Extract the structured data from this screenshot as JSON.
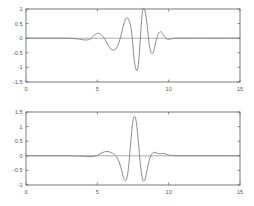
{
  "figure": {
    "title": "",
    "background_color": "#ffffff",
    "curve_color": "#777777",
    "axis_color": "#6b6b6b",
    "label_color": "#585858"
  },
  "chart_data": [
    {
      "type": "line",
      "title": "",
      "xlabel": "",
      "ylabel": "",
      "xlim": [
        0,
        15
      ],
      "ylim": [
        -1.5,
        1.0
      ],
      "grid": false,
      "legend": null,
      "xticks": [
        0,
        5,
        10,
        15
      ],
      "xticklabels": [
        "0",
        "5",
        "10",
        "15"
      ],
      "yticks": [
        1,
        0.5,
        0,
        -0.5,
        -1,
        -1.5
      ],
      "yticklabels": [
        "1",
        "0.5",
        "0",
        "-0.5",
        "-1",
        "-1.5"
      ],
      "series": [
        {
          "name": "signal-1",
          "x": [
            0.0,
            0.5,
            1.0,
            1.5,
            2.0,
            2.5,
            3.0,
            3.3,
            3.6,
            3.9,
            4.1,
            4.25,
            4.4,
            4.55,
            4.7,
            4.85,
            5.0,
            5.15,
            5.3,
            5.45,
            5.6,
            5.75,
            5.9,
            6.05,
            6.2,
            6.35,
            6.5,
            6.65,
            6.8,
            6.95,
            7.1,
            7.25,
            7.4,
            7.5,
            7.6,
            7.7,
            7.8,
            7.9,
            8.0,
            8.1,
            8.2,
            8.35,
            8.5,
            8.65,
            8.8,
            8.95,
            9.1,
            9.25,
            9.4,
            9.55,
            9.7,
            9.85,
            10.0,
            10.2,
            10.5,
            11.0,
            11.5,
            12.0,
            13.0,
            14.0,
            15.0
          ],
          "y": [
            0.0,
            0.0,
            0.0,
            0.0,
            0.0,
            0.0,
            -0.005,
            -0.012,
            -0.025,
            -0.045,
            -0.06,
            -0.062,
            -0.05,
            -0.015,
            0.06,
            0.13,
            0.165,
            0.155,
            0.105,
            0.02,
            -0.1,
            -0.23,
            -0.34,
            -0.4,
            -0.4,
            -0.33,
            -0.17,
            0.08,
            0.38,
            0.62,
            0.7,
            0.58,
            0.22,
            -0.3,
            -0.8,
            -1.05,
            -1.1,
            -0.8,
            -0.1,
            0.6,
            1.0,
            0.92,
            0.4,
            -0.25,
            -0.52,
            -0.44,
            -0.12,
            0.12,
            0.22,
            0.18,
            0.07,
            -0.02,
            -0.04,
            -0.02,
            0.0,
            0.0,
            0.0,
            0.0,
            0.0,
            0.0,
            0.0
          ]
        }
      ]
    },
    {
      "type": "line",
      "title": "",
      "xlabel": "",
      "ylabel": "",
      "xlim": [
        0,
        15
      ],
      "ylim": [
        -1.0,
        1.5
      ],
      "grid": false,
      "legend": null,
      "xticks": [
        0,
        5,
        10,
        15
      ],
      "xticklabels": [
        "0",
        "5",
        "10",
        "15"
      ],
      "yticks": [
        1.5,
        1,
        0.5,
        0,
        -0.5,
        -1
      ],
      "yticklabels": [
        "1.5",
        "1",
        "0.5",
        "0",
        "-0.5",
        "-1"
      ],
      "series": [
        {
          "name": "signal-2",
          "x": [
            0.0,
            0.5,
            1.0,
            1.5,
            2.0,
            2.5,
            3.0,
            3.5,
            4.0,
            4.4,
            4.7,
            5.0,
            5.2,
            5.4,
            5.6,
            5.75,
            5.9,
            6.05,
            6.2,
            6.35,
            6.5,
            6.6,
            6.7,
            6.8,
            6.9,
            7.0,
            7.1,
            7.2,
            7.3,
            7.4,
            7.5,
            7.6,
            7.7,
            7.8,
            7.9,
            8.0,
            8.1,
            8.2,
            8.3,
            8.4,
            8.5,
            8.6,
            8.75,
            8.9,
            9.05,
            9.2,
            9.4,
            9.6,
            9.8,
            10.0,
            10.2,
            10.5,
            11.0,
            11.5,
            12.0,
            13.0,
            14.0,
            15.0
          ],
          "y": [
            0.0,
            0.0,
            0.0,
            0.0,
            0.0,
            0.0,
            0.0,
            -0.005,
            -0.015,
            -0.025,
            -0.02,
            0.02,
            0.07,
            0.12,
            0.145,
            0.145,
            0.125,
            0.09,
            0.04,
            -0.04,
            -0.18,
            -0.32,
            -0.5,
            -0.7,
            -0.82,
            -0.85,
            -0.7,
            -0.33,
            0.22,
            0.8,
            1.22,
            1.35,
            1.25,
            0.88,
            0.35,
            -0.2,
            -0.62,
            -0.84,
            -0.85,
            -0.7,
            -0.45,
            -0.22,
            0.0,
            0.1,
            0.12,
            0.09,
            0.07,
            0.08,
            0.06,
            0.03,
            0.01,
            0.0,
            0.0,
            0.0,
            0.0,
            0.0,
            0.0,
            0.0
          ]
        }
      ]
    }
  ]
}
